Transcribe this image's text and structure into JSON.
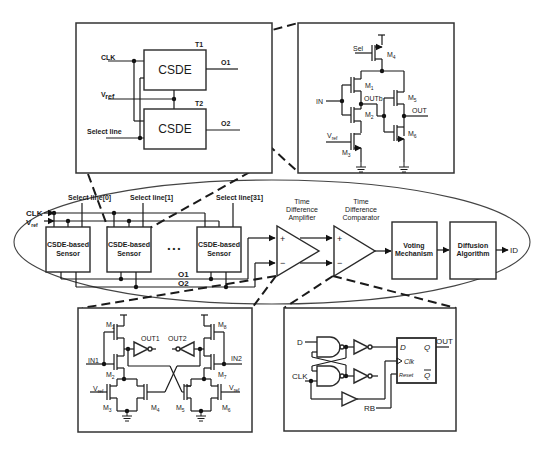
{
  "top_left_inset": {
    "clk_label": "CLK",
    "vref_label": "V",
    "vref_sub": "ref",
    "select_label": "Select line",
    "block1": {
      "label": "CSDE",
      "tag": "T1",
      "output": "O1"
    },
    "block2": {
      "label": "CSDE",
      "tag": "T2",
      "output": "O2"
    }
  },
  "top_right_inset": {
    "sel_label": "Sel",
    "in_label": "IN",
    "outb_label": "OUTb",
    "out_label": "OUT",
    "vref_label": "V",
    "vref_sub": "ref",
    "transistors": [
      {
        "name": "M",
        "sub": "4"
      },
      {
        "name": "M",
        "sub": "1"
      },
      {
        "name": "M",
        "sub": "2"
      },
      {
        "name": "M",
        "sub": "3"
      },
      {
        "name": "M",
        "sub": "5"
      },
      {
        "name": "M",
        "sub": "6"
      }
    ]
  },
  "main_chain": {
    "clk_label": "CLK",
    "vref_label": "V",
    "vref_sub": "ref",
    "select_lines": [
      "Select line[0]",
      "Select line[1]",
      "Select line[31]"
    ],
    "sensors": [
      {
        "line1": "CSDE-based",
        "line2": "Sensor"
      },
      {
        "line1": "CSDE-based",
        "line2": "Sensor"
      },
      {
        "line1": "CSDE-based",
        "line2": "Sensor"
      }
    ],
    "ellipsis": "• • •",
    "bus_o1": "O1",
    "bus_o2": "O2",
    "tda": {
      "line1": "Time",
      "line2": "Difference",
      "line3": "Amplifier",
      "plus": "+",
      "minus": "−"
    },
    "tdc": {
      "line1": "Time",
      "line2": "Difference",
      "line3": "Comparator",
      "plus": "+",
      "minus": "−"
    },
    "voting": {
      "line1": "Voting",
      "line2": "Mechanism"
    },
    "diffusion": {
      "line1": "Diffusion",
      "line2": "Algorithm"
    },
    "output": "ID"
  },
  "bottom_left_inset": {
    "in1": "IN1",
    "in2": "IN2",
    "out1": "OUT1",
    "out2": "OUT2",
    "vref_left": "V",
    "vref_right": "V",
    "vref_sub": "ref",
    "left_transistors": [
      {
        "name": "M",
        "sub": "1"
      },
      {
        "name": "M",
        "sub": "2"
      },
      {
        "name": "M",
        "sub": "3"
      },
      {
        "name": "M",
        "sub": "4"
      }
    ],
    "right_transistors": [
      {
        "name": "M",
        "sub": "8"
      },
      {
        "name": "M",
        "sub": "7"
      },
      {
        "name": "M",
        "sub": "5"
      },
      {
        "name": "M",
        "sub": "6"
      }
    ]
  },
  "bottom_right_inset": {
    "d_in": "D",
    "clk_in": "CLK",
    "rb_in": "RB",
    "ff_d": "D",
    "ff_q": "Q",
    "ff_clk": "Clk",
    "ff_reset": "Reset",
    "ff_qbar": "Q",
    "out": "OUT"
  }
}
